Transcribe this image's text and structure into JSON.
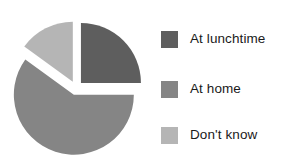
{
  "chart_data": {
    "type": "pie",
    "title": "",
    "subtitle": "",
    "xlabel": "",
    "ylabel": "",
    "grid": false,
    "legend_position": "right",
    "exploded": true,
    "categories": [
      "At lunchtime",
      "At home",
      "Don't know"
    ],
    "values": [
      25,
      60,
      15
    ],
    "unit": "percent",
    "slices": [
      {
        "label": "At lunchtime",
        "value": 25,
        "color": "#5e5e5e",
        "start_angle_deg": 0,
        "end_angle_deg": 90,
        "explode_direction_deg": 45
      },
      {
        "label": "At home",
        "value": 60,
        "color": "#858585",
        "start_angle_deg": 90,
        "end_angle_deg": 306,
        "explode_direction_deg": 198
      },
      {
        "label": "Don't know",
        "value": 15,
        "color": "#b5b5b5",
        "start_angle_deg": 306,
        "end_angle_deg": 360,
        "explode_direction_deg": 333
      }
    ],
    "background": "#ffffff"
  },
  "legend": {
    "items": [
      {
        "label": "At lunchtime",
        "color": "#5e5e5e",
        "swatch_name": "legend-swatch-at-lunchtime"
      },
      {
        "label": "At home",
        "color": "#858585",
        "swatch_name": "legend-swatch-at-home"
      },
      {
        "label": "Don't know",
        "color": "#b5b5b5",
        "swatch_name": "legend-swatch-dont-know"
      }
    ]
  }
}
